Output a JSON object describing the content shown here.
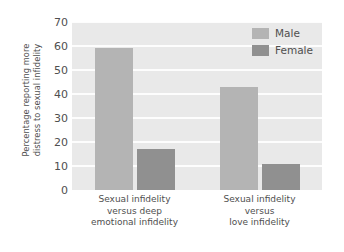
{
  "chart_data": {
    "type": "bar",
    "title": "",
    "xlabel": "",
    "ylabel": "Percentage reporting more\ndistress to sexual infidelity",
    "ylim": [
      0,
      70
    ],
    "yticks": [
      0,
      10,
      20,
      30,
      40,
      50,
      60,
      70
    ],
    "grid": true,
    "legend_position": "top-right",
    "categories": [
      "Sexual infidelity\nversus deep\nemotional infidelity",
      "Sexual infidelity\nversus\nlove infidelity"
    ],
    "series": [
      {
        "name": "Male",
        "values": [
          59,
          43
        ],
        "color": "#b4b4b4"
      },
      {
        "name": "Female",
        "values": [
          17,
          11
        ],
        "color": "#909090"
      }
    ]
  },
  "legend": {
    "items": [
      {
        "label": "Male"
      },
      {
        "label": "Female"
      }
    ]
  },
  "axis": {
    "y_title": "Percentage reporting more\ndistress to sexual infidelity",
    "tick_0": "0",
    "tick_10": "10",
    "tick_20": "20",
    "tick_30": "30",
    "tick_40": "40",
    "tick_50": "50",
    "tick_60": "60",
    "tick_70": "70"
  },
  "colors": {
    "plot_background": "#e9e9e9",
    "gridline": "#fdfdfd",
    "male_bar": "#b4b4b4",
    "female_bar": "#909090",
    "text": "#4f4f4f",
    "page_background": "#ffffff"
  }
}
